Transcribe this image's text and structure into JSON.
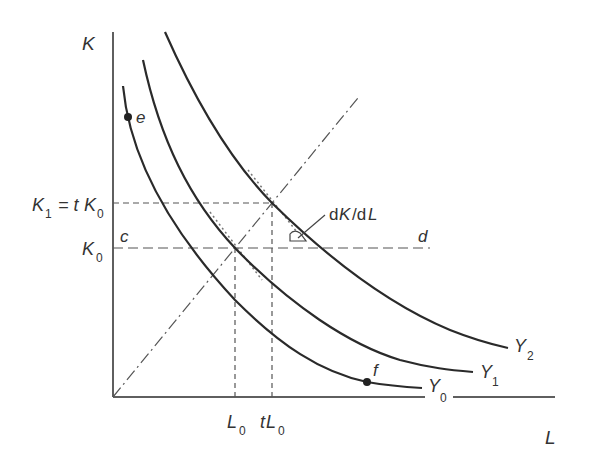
{
  "diagram": {
    "axes": {
      "y_label": "K",
      "x_label": "L"
    },
    "y_ticks": {
      "k1_main": "K",
      "k1_sub": "1",
      "k1_eq": " = t",
      "k1_k": "K",
      "k1_k_sub": "0",
      "k0_main": "K",
      "k0_sub": "0"
    },
    "x_ticks": {
      "l0_main": "L",
      "l0_sub": "0",
      "tl0_t": "t",
      "tl0_main": "L",
      "tl0_sub": "0"
    },
    "isoquants": [
      {
        "main": "Y",
        "sub": "0"
      },
      {
        "main": "Y",
        "sub": "1"
      },
      {
        "main": "Y",
        "sub": "2"
      }
    ],
    "points": {
      "e": "e",
      "f": "f",
      "c": "c",
      "d": "d"
    },
    "slope_label": {
      "d1": "d",
      "k": "K",
      "slash": "/d",
      "l": "L"
    },
    "colors": {
      "line": "#2a2a2a",
      "dash": "#555555",
      "text": "#333333"
    }
  }
}
